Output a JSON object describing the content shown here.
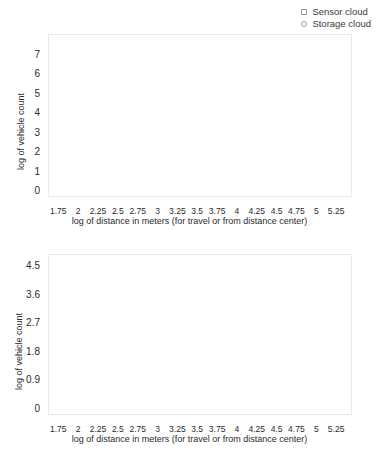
{
  "figure": {
    "background": "#ffffff",
    "marker_color": "#1a1a1a",
    "line_color": "#8c8c8c",
    "frame_color": "#e9e9e9"
  },
  "legend": {
    "position": "top-right",
    "entries": [
      {
        "label": "Sensor cloud",
        "marker": "square",
        "icon": "square-marker-icon"
      },
      {
        "label": "Storage cloud",
        "marker": "circle",
        "icon": "circle-marker-icon"
      }
    ]
  },
  "chart_data": [
    {
      "type": "line",
      "id": "top-panel",
      "title": "",
      "xlabel": "log of distance in meters (for travel or from distance center)",
      "ylabel": "log of vehicle count",
      "xlim": [
        1.62,
        5.45
      ],
      "ylim": [
        -0.35,
        8.0
      ],
      "grid": false,
      "xticks": [
        1.75,
        2,
        2.25,
        2.5,
        2.75,
        3,
        3.25,
        3.5,
        3.75,
        4,
        4.25,
        4.5,
        4.75,
        5,
        5.25
      ],
      "xticklabels": [
        "1.75",
        "2",
        "2.25",
        "2.5",
        "2.75",
        "3",
        "3.25",
        "3.5",
        "3.75",
        "4",
        "4.25",
        "4.5",
        "4.75",
        "5",
        "5.25"
      ],
      "yticks": [
        0,
        1,
        2,
        3,
        4,
        5,
        6,
        7
      ],
      "yticklabels": [
        "0",
        "1",
        "2",
        "3",
        "4",
        "5",
        "6",
        "7"
      ],
      "series": [
        {
          "name": "Sensor cloud",
          "marker": "square",
          "x": [
            2.0,
            2.5,
            2.78,
            2.88,
            2.98,
            3.06,
            3.14,
            3.22,
            3.3,
            3.38,
            3.46,
            3.54,
            3.62,
            3.7,
            3.78,
            3.86,
            3.94,
            4.0
          ],
          "y": [
            7.62,
            7.52,
            7.38,
            7.28,
            7.24,
            7.22,
            7.16,
            7.12,
            7.24,
            7.26,
            7.28,
            7.42,
            7.32,
            7.28,
            7.26,
            7.18,
            7.26,
            6.98
          ]
        },
        {
          "name": "Storage cloud",
          "marker": "circle",
          "x": [
            3.76,
            3.98,
            4.16,
            4.28,
            4.38,
            4.5,
            4.62,
            4.72,
            4.82,
            4.92,
            5.02,
            5.1,
            5.18,
            5.26,
            5.34
          ],
          "y": [
            5.35,
            4.98,
            4.32,
            3.68,
            3.18,
            2.78,
            0.0,
            0.0,
            0.0,
            0.0,
            0.0,
            0.0,
            0.0,
            0.0,
            0.0
          ]
        }
      ]
    },
    {
      "type": "line",
      "id": "bottom-panel",
      "title": "",
      "xlabel": "log of distance in meters (for travel or from distance center)",
      "ylabel": "log of vehicle count",
      "xlim": [
        1.62,
        5.45
      ],
      "ylim": [
        -0.22,
        4.85
      ],
      "grid": false,
      "xticks": [
        1.75,
        2,
        2.25,
        2.5,
        2.75,
        3,
        3.25,
        3.5,
        3.75,
        4,
        4.25,
        4.5,
        4.75,
        5,
        5.25
      ],
      "xticklabels": [
        "1.75",
        "2",
        "2.25",
        "2.5",
        "2.75",
        "3",
        "3.25",
        "3.5",
        "3.75",
        "4",
        "4.25",
        "4.5",
        "4.75",
        "5",
        "5.25"
      ],
      "yticks": [
        0,
        0.9,
        1.8,
        2.7,
        3.6,
        4.5
      ],
      "yticklabels": [
        "0",
        "0.9",
        "1.8",
        "2.7",
        "3.6",
        "4.5"
      ],
      "series": [
        {
          "name": "Sensor cloud",
          "marker": "square",
          "x": [
            2.0,
            2.46,
            2.76,
            2.88,
            2.98,
            3.06,
            3.14,
            3.22,
            3.3,
            3.38,
            3.46,
            3.54,
            3.62,
            3.7,
            3.78,
            3.86,
            3.96,
            4.06
          ],
          "y": [
            4.5,
            4.44,
            4.02,
            3.8,
            3.72,
            3.6,
            3.5,
            3.44,
            3.28,
            3.48,
            3.5,
            3.62,
            3.78,
            3.66,
            3.62,
            3.52,
            3.58,
            3.22
          ]
        },
        {
          "name": "Storage cloud",
          "marker": "circle",
          "x": [
            3.88,
            4.06,
            4.2,
            4.32,
            4.42,
            4.52,
            4.62,
            4.72,
            4.82,
            4.92,
            5.0,
            5.08,
            5.16,
            5.24,
            5.32
          ],
          "y": [
            3.5,
            3.14,
            2.56,
            2.02,
            1.6,
            1.22,
            0.0,
            0.0,
            0.0,
            0.0,
            0.0,
            0.0,
            0.0,
            0.0,
            0.0
          ]
        }
      ]
    }
  ]
}
